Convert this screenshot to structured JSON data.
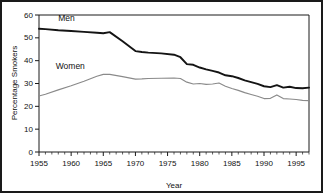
{
  "chart_data": {
    "type": "line",
    "title": "",
    "xlabel": "Year",
    "ylabel": "Percentage Smokers",
    "xlim": [
      1955,
      1997
    ],
    "ylim": [
      0,
      60
    ],
    "xticks": [
      1955,
      1960,
      1965,
      1970,
      1975,
      1980,
      1985,
      1990,
      1995
    ],
    "yticks": [
      0,
      10,
      20,
      30,
      40,
      50,
      60
    ],
    "xtick_labels": [
      "1955",
      "1960",
      "1965",
      "1970",
      "1975",
      "1980",
      "1985",
      "1990",
      "1995"
    ],
    "ytick_labels": [
      "0",
      "10",
      "20",
      "30",
      "40",
      "50",
      "60"
    ],
    "xminor_step": 1,
    "grid": false,
    "legend": "inline-annotations",
    "annotations": [
      {
        "text": "Men",
        "x": 1958.0,
        "y": 57.2
      },
      {
        "text": "Women",
        "x": 1957.6,
        "y": 36.4
      }
    ],
    "series": [
      {
        "name": "Men",
        "color": "#141414",
        "label": "Men",
        "x": [
          1955,
          1956,
          1958,
          1960,
          1962,
          1964,
          1965,
          1966,
          1968,
          1970,
          1971,
          1972,
          1974,
          1976,
          1977,
          1978,
          1979,
          1980,
          1981,
          1982,
          1983,
          1984,
          1985,
          1986,
          1987,
          1988,
          1989,
          1990,
          1991,
          1992,
          1993,
          1994,
          1995,
          1996,
          1997
        ],
        "values": [
          54.0,
          53.8,
          53.3,
          53.0,
          52.6,
          52.2,
          52.0,
          52.5,
          48.5,
          44.2,
          43.8,
          43.5,
          43.2,
          42.6,
          41.5,
          38.5,
          38.2,
          37.0,
          36.2,
          35.5,
          34.8,
          33.6,
          33.2,
          32.4,
          31.4,
          30.6,
          29.8,
          28.8,
          28.4,
          29.3,
          28.2,
          28.6,
          28.0,
          27.9,
          28.2
        ]
      },
      {
        "name": "Women",
        "color": "#8a8a8a",
        "label": "Women",
        "x": [
          1955,
          1956,
          1958,
          1960,
          1962,
          1964,
          1965,
          1966,
          1968,
          1970,
          1971,
          1972,
          1974,
          1976,
          1977,
          1978,
          1979,
          1980,
          1981,
          1982,
          1983,
          1984,
          1985,
          1986,
          1987,
          1988,
          1989,
          1990,
          1991,
          1992,
          1993,
          1994,
          1995,
          1996,
          1997
        ],
        "values": [
          24.5,
          25.3,
          27.2,
          29.0,
          31.0,
          33.2,
          34.0,
          34.0,
          33.0,
          31.9,
          32.0,
          32.2,
          32.3,
          32.4,
          32.2,
          30.6,
          29.8,
          30.0,
          29.6,
          29.8,
          30.2,
          28.8,
          27.8,
          27.0,
          26.0,
          25.2,
          24.4,
          23.4,
          23.5,
          25.0,
          23.4,
          23.2,
          23.0,
          22.6,
          22.5
        ]
      }
    ]
  }
}
